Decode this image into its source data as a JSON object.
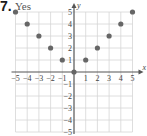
{
  "problem": {
    "number": "7.",
    "answer": "Yes"
  },
  "colors": {
    "grid": "#d6d6d6",
    "axis": "#555555",
    "point": "#666666",
    "text": "#444444"
  },
  "chart_data": {
    "type": "scatter",
    "title": "",
    "xlabel": "x",
    "ylabel": "y",
    "xlim": [
      -5,
      5
    ],
    "ylim": [
      -5,
      5
    ],
    "grid": true,
    "x_ticks": [
      "−5",
      "−4",
      "−3",
      "−2",
      "−1",
      "1",
      "2",
      "3",
      "4",
      "5"
    ],
    "y_ticks": [
      "5",
      "4",
      "3",
      "2",
      "1",
      "−1",
      "−2",
      "−3",
      "−4",
      "−5"
    ],
    "series": [
      {
        "name": "points",
        "points": [
          {
            "x": -5,
            "y": 5
          },
          {
            "x": -4,
            "y": 4
          },
          {
            "x": -3,
            "y": 3
          },
          {
            "x": -2,
            "y": 2
          },
          {
            "x": -1,
            "y": 1
          },
          {
            "x": 0,
            "y": 0
          },
          {
            "x": 1,
            "y": 1
          },
          {
            "x": 2,
            "y": 2
          },
          {
            "x": 3,
            "y": 3
          },
          {
            "x": 4,
            "y": 4
          },
          {
            "x": 5,
            "y": 5
          }
        ]
      }
    ]
  }
}
